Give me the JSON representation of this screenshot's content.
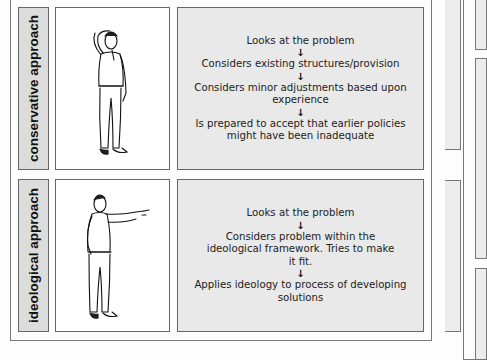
{
  "rows": [
    {
      "label": "conservative approach",
      "illustration": "man-hand-on-head-icon",
      "steps": [
        "Looks at the problem",
        "Considers existing structures/provision",
        "Considers minor adjustments based upon experience",
        "Is prepared to accept that earlier policies might have been inadequate"
      ],
      "arrow": "↓"
    },
    {
      "label": "ideological approach",
      "illustration": "man-pointing-icon",
      "steps": [
        "Looks at the problem",
        "Considers problem within the ideological framework. Tries to make it fit.",
        "Applies ideology to process of developing solutions"
      ],
      "arrow": "↓"
    }
  ],
  "colors": {
    "label_bg": "#dcdcdc",
    "text_box_bg": "#e9e9e9",
    "border": "#666666"
  }
}
